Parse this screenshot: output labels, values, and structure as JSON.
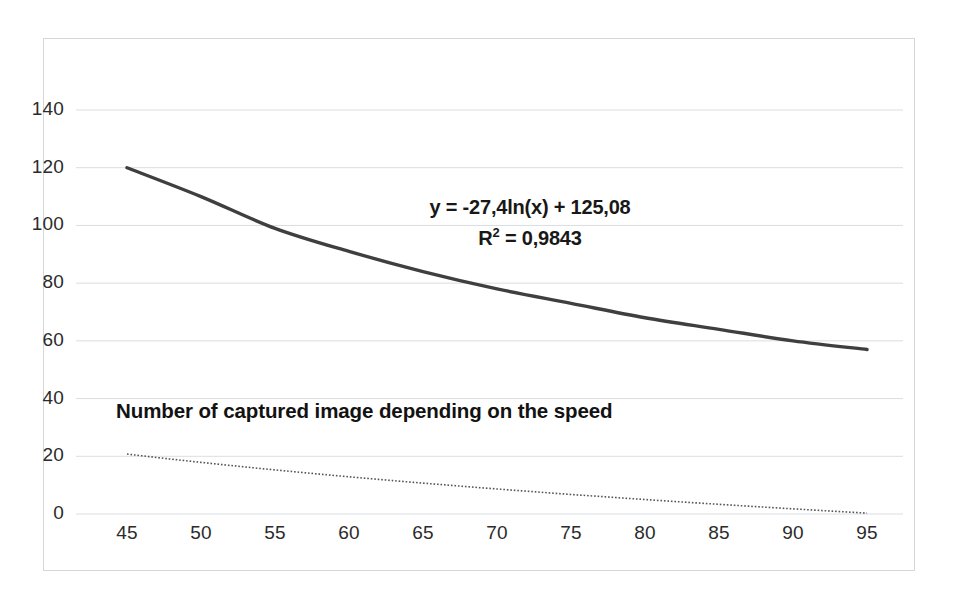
{
  "chart_data": {
    "type": "line",
    "title": "Number of captured image depending on the speed",
    "xlabel": "",
    "ylabel": "",
    "xlim": [
      45,
      95
    ],
    "ylim": [
      0,
      140
    ],
    "grid": true,
    "legend": "none",
    "xticks": [
      "45",
      "50",
      "55",
      "60",
      "65",
      "70",
      "75",
      "80",
      "85",
      "90",
      "95"
    ],
    "yticks": [
      "0",
      "20",
      "40",
      "60",
      "80",
      "100",
      "120",
      "140"
    ],
    "x": [
      45,
      50,
      55,
      60,
      65,
      70,
      75,
      80,
      85,
      90,
      95
    ],
    "series": [
      {
        "name": "Number of captured image",
        "style": "solid",
        "color": "#3f3f3f",
        "values": [
          120,
          110,
          99,
          91,
          84,
          78,
          73,
          68,
          64,
          60,
          57
        ]
      },
      {
        "name": "Log. trendline",
        "style": "dotted",
        "color": "#555555",
        "equation": "y = -27,4ln(x) + 125,08",
        "r_squared": "R² = 0,9843",
        "values": [
          20.79,
          17.94,
          15.32,
          12.9,
          10.66,
          8.56,
          6.6,
          4.75,
          3.0,
          1.35,
          -0.22
        ]
      }
    ],
    "annotations": {
      "equation": "y = -27,4ln(x) + 125,08",
      "r_squared_prefix": "R",
      "r_squared_exp": "2",
      "r_squared_value": " = 0,9843"
    },
    "colors": {
      "series_line": "#3f3f3f",
      "trendline": "#555555",
      "gridline": "#d9dde2",
      "border": "#d6d6d6",
      "text": "#2b2b2b",
      "background": "#ffffff"
    }
  }
}
